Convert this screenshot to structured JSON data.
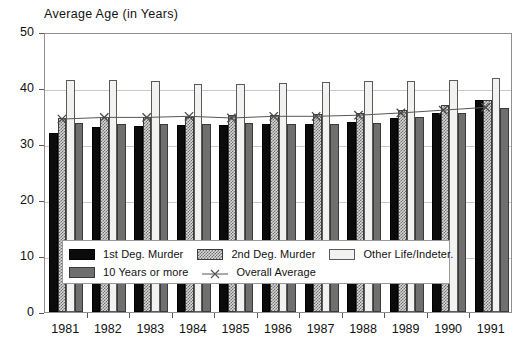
{
  "chart_data": {
    "type": "bar",
    "title": "Average Age (in Years)",
    "xlabel": "",
    "ylabel": "Average Age (in Years)",
    "ylim": [
      0,
      50
    ],
    "yticks": [
      0,
      10,
      20,
      30,
      40,
      50
    ],
    "grid": true,
    "legend_position": "inside-bottom",
    "categories": [
      "1981",
      "1982",
      "1983",
      "1984",
      "1985",
      "1986",
      "1987",
      "1988",
      "1989",
      "1990",
      "1991"
    ],
    "series": [
      {
        "name": "1st Deg. Murder",
        "type": "bar",
        "values": [
          32.0,
          33.0,
          33.3,
          33.4,
          33.4,
          33.5,
          33.6,
          34.0,
          34.7,
          35.5,
          37.9
        ]
      },
      {
        "name": "2nd Deg. Murder",
        "type": "bar",
        "values": [
          34.6,
          34.9,
          34.8,
          34.9,
          35.2,
          35.1,
          35.3,
          35.6,
          36.1,
          37.0,
          37.9
        ]
      },
      {
        "name": "Other Life/Indeter.",
        "type": "bar",
        "values": [
          41.5,
          41.4,
          41.2,
          40.8,
          40.7,
          40.9,
          41.1,
          41.2,
          41.3,
          41.4,
          41.7
        ]
      },
      {
        "name": "10 Years or more",
        "type": "bar",
        "values": [
          33.8,
          33.6,
          33.6,
          33.6,
          33.8,
          33.6,
          33.6,
          33.7,
          34.9,
          35.5,
          36.5
        ]
      },
      {
        "name": "Overall Average",
        "type": "line",
        "values": [
          34.7,
          35.0,
          35.0,
          35.2,
          34.9,
          35.2,
          35.2,
          35.4,
          35.8,
          36.3,
          36.8
        ]
      }
    ],
    "series_colors": [
      "#0b0b0b",
      "#b9b9b9",
      "#f2f2f0",
      "#6f6f6f",
      "#555555"
    ],
    "marker": "x"
  },
  "legend": {
    "items": [
      {
        "label": "1st Deg. Murder",
        "swatch": "black-solid-swatch"
      },
      {
        "label": "2nd Deg. Murder",
        "swatch": "hatched-gray-swatch"
      },
      {
        "label": "Other Life/Indeter.",
        "swatch": "white-swatch"
      },
      {
        "label": "10 Years or more",
        "swatch": "dark-gray-swatch"
      },
      {
        "label": "Overall Average",
        "swatch": "line-x-marker-swatch"
      }
    ]
  },
  "axes": {
    "y_labels": [
      "50",
      "40",
      "30",
      "20",
      "10",
      "0"
    ],
    "x_labels": [
      "1981",
      "1982",
      "1983",
      "1984",
      "1985",
      "1986",
      "1987",
      "1988",
      "1989",
      "1990",
      "1991"
    ]
  }
}
